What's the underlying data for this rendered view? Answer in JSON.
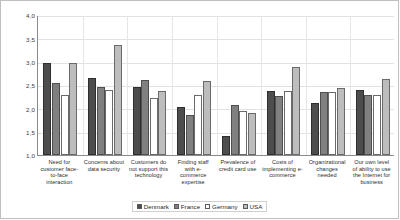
{
  "chart_data": {
    "type": "bar",
    "title": "",
    "xlabel": "",
    "ylabel": "",
    "ylim": [
      1.0,
      4.0
    ],
    "ytick_labels": [
      "4,0",
      "3,5",
      "3,0",
      "2,5",
      "2,0",
      "1,5",
      "1,0"
    ],
    "ytick_values": [
      4.0,
      3.5,
      3.0,
      2.5,
      2.0,
      1.5,
      1.0
    ],
    "grid": true,
    "legend_position": "bottom",
    "decimal_separator": ",",
    "categories": [
      "Need for customer face-to-face interaction",
      "Concerns about data security",
      "Customers do not support this technology",
      "Finding staff with e-commerce expertise",
      "Prevalence of credit card use",
      "Costs of implementing e-commerce",
      "Organizational changes needed",
      "Our own level of ability to use the Internet for business"
    ],
    "category_lines": [
      [
        "Need for",
        "customer face-",
        "to-face",
        "interaction"
      ],
      [
        "Concerns about",
        "data security"
      ],
      [
        "Customers do",
        "not support this",
        "technology"
      ],
      [
        "Finding staff",
        "with e-",
        "commerce",
        "expertise"
      ],
      [
        "Prevalence of",
        "credit card use"
      ],
      [
        "Costs of",
        "implementing e-",
        "commerce"
      ],
      [
        "Organizational",
        "changes",
        "needed"
      ],
      [
        "Our own level",
        "of ability to use",
        "the Internet for",
        "business"
      ]
    ],
    "series": [
      {
        "name": "Denmark",
        "color": "#4d4d4d",
        "values": [
          2.97,
          2.66,
          2.46,
          2.03,
          1.41,
          2.38,
          2.12,
          2.4
        ]
      },
      {
        "name": "France",
        "color": "#808080",
        "values": [
          2.55,
          2.46,
          2.61,
          1.86,
          2.08,
          2.27,
          2.35,
          2.29
        ]
      },
      {
        "name": "Germany",
        "color": "#ffffff",
        "values": [
          2.29,
          2.4,
          2.22,
          2.29,
          1.95,
          2.37,
          2.35,
          2.29
        ]
      },
      {
        "name": "USA",
        "color": "#bdbdbd",
        "values": [
          2.98,
          3.35,
          2.37,
          2.58,
          1.9,
          2.89,
          2.44,
          2.62
        ]
      }
    ]
  },
  "legend": {
    "items": [
      {
        "label": "Denmark"
      },
      {
        "label": "France"
      },
      {
        "label": "Germany"
      },
      {
        "label": "USA"
      }
    ]
  }
}
